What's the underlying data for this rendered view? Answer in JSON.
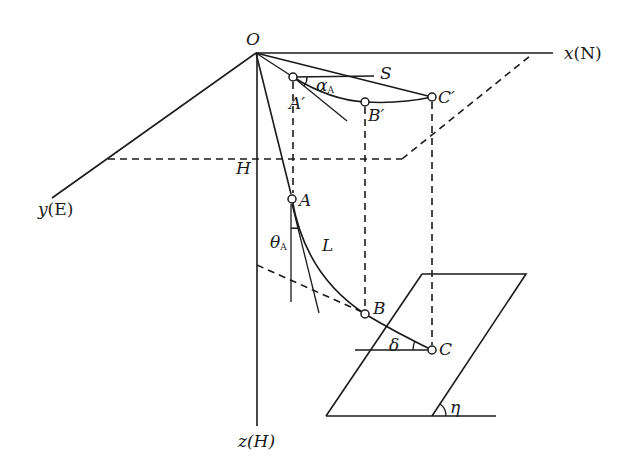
{
  "diagram": {
    "type": "3D coordinate diagram - wellbore trajectory projection",
    "stroke_color": "#1a1a1a",
    "background": "#ffffff",
    "axes": {
      "x": {
        "name": "x",
        "unit": "(N)"
      },
      "y": {
        "name": "y",
        "unit": "(E)"
      },
      "z": {
        "name": "z",
        "unit": "(H)"
      }
    },
    "labels": {
      "origin": "O",
      "depth": "H",
      "point_a": "A",
      "point_b": "B",
      "point_c": "C",
      "point_a_proj": "A′",
      "point_b_proj": "B′",
      "point_c_proj": "C′",
      "horizontal_ref": "S",
      "alpha": "α",
      "alpha_sub": "A",
      "theta": "θ",
      "theta_sub": "A",
      "curve_length": "L",
      "delta": "δ",
      "eta": "η"
    },
    "points": {
      "O": [
        256,
        53
      ],
      "A": [
        292,
        199
      ],
      "B": [
        365,
        314
      ],
      "C": [
        432,
        350
      ],
      "A_prime": [
        293,
        77
      ],
      "B_prime": [
        365,
        102
      ],
      "C_prime": [
        432,
        97
      ]
    }
  }
}
